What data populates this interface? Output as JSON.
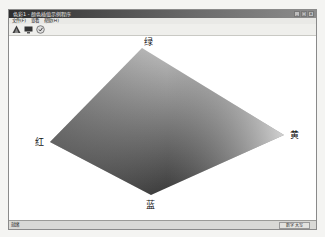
{
  "window": {
    "title": "色彩1 - 颜色插值示例程序",
    "controls": [
      "minimize",
      "maximize",
      "close"
    ]
  },
  "menu": {
    "items": [
      {
        "label": "文件(F)"
      },
      {
        "label": "查看"
      },
      {
        "label": "帮助(H)"
      }
    ]
  },
  "toolbar": {
    "buttons": [
      {
        "icon": "triangle-icon"
      },
      {
        "icon": "monitor-icon"
      },
      {
        "icon": "help-icon"
      }
    ]
  },
  "canvas": {
    "shape": "gradient-diamond",
    "vertices": {
      "top": {
        "label": "绿",
        "x": 133,
        "y": 12
      },
      "left": {
        "label": "红",
        "x": 41,
        "y": 106
      },
      "right": {
        "label": "黄",
        "x": 275,
        "y": 99
      },
      "bottom": {
        "label": "蓝",
        "x": 142,
        "y": 159
      }
    },
    "colors": {
      "top": "#bdbdbd",
      "left": "#6f6f6f",
      "right": "#e4e4e4",
      "bottom": "#3a3a3a"
    }
  },
  "statusbar": {
    "left": "就绪",
    "right": "数字 大写"
  }
}
